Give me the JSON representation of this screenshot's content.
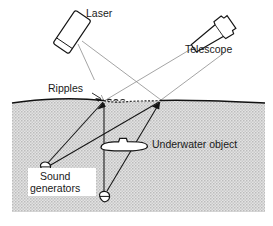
{
  "figure": {
    "name": "underwater-acoustic-ripple-detection-diagram",
    "background_color": "#ffffff",
    "ink_color": "#141414",
    "water_fill_color": "#d2d2d2",
    "laser_ray_color": "#8d8d8d",
    "sound_ray_color": "#141414"
  },
  "labels": {
    "laser": "Laser",
    "telescope": "Telescope",
    "ripples": "Ripples",
    "underwater_object": "Underwater object",
    "sound_generators_line1": "Sound",
    "sound_generators_line2": "generators"
  },
  "components": {
    "laser": {
      "label": "Laser",
      "shape": "tilted-rectangular-box",
      "emits": "two-diverging-laser-beams"
    },
    "telescope": {
      "label": "Telescope",
      "shape": "tapered-tube",
      "receives": "two-reflected-laser-beams"
    },
    "water_surface": {
      "label": "Ripples",
      "shape": "wavy-line-with-rippled-segment"
    },
    "underwater_object": {
      "label": "Underwater object",
      "shape": "submarine-silhouette"
    },
    "sound_generators": {
      "label": "Sound generators",
      "count": 2,
      "shape": "small-circle-with-bar"
    }
  },
  "geometry": {
    "water_region": {
      "x": 12,
      "y": 103,
      "width": 253,
      "height": 109
    },
    "laser_box": {
      "cx": 72,
      "cy": 32,
      "angle_deg": 34
    },
    "telescope_body": {
      "cx": 212,
      "cy": 36,
      "angle_deg": -35
    },
    "surface_hit_left": {
      "x": 104,
      "y": 102
    },
    "surface_hit_right": {
      "x": 160,
      "y": 101
    },
    "generator_left": {
      "x": 45,
      "y": 167
    },
    "generator_right": {
      "x": 105,
      "y": 197
    },
    "submarine": {
      "x": 101,
      "y": 138,
      "width": 46,
      "height": 13
    }
  },
  "rays": {
    "laser_beams": [
      {
        "from": "laser",
        "to": "surface_hit_left"
      },
      {
        "from": "laser",
        "to": "surface_hit_right"
      }
    ],
    "reflected_beams": [
      {
        "from": "surface_hit_left",
        "to": "telescope"
      },
      {
        "from": "surface_hit_right",
        "to": "telescope"
      }
    ],
    "sound_paths": [
      {
        "from": "generator_left",
        "to": "surface_hit_left"
      },
      {
        "from": "generator_left",
        "to": "surface_hit_right"
      },
      {
        "from": "generator_right",
        "to": "surface_hit_left"
      },
      {
        "from": "generator_right",
        "to": "surface_hit_right"
      }
    ]
  }
}
